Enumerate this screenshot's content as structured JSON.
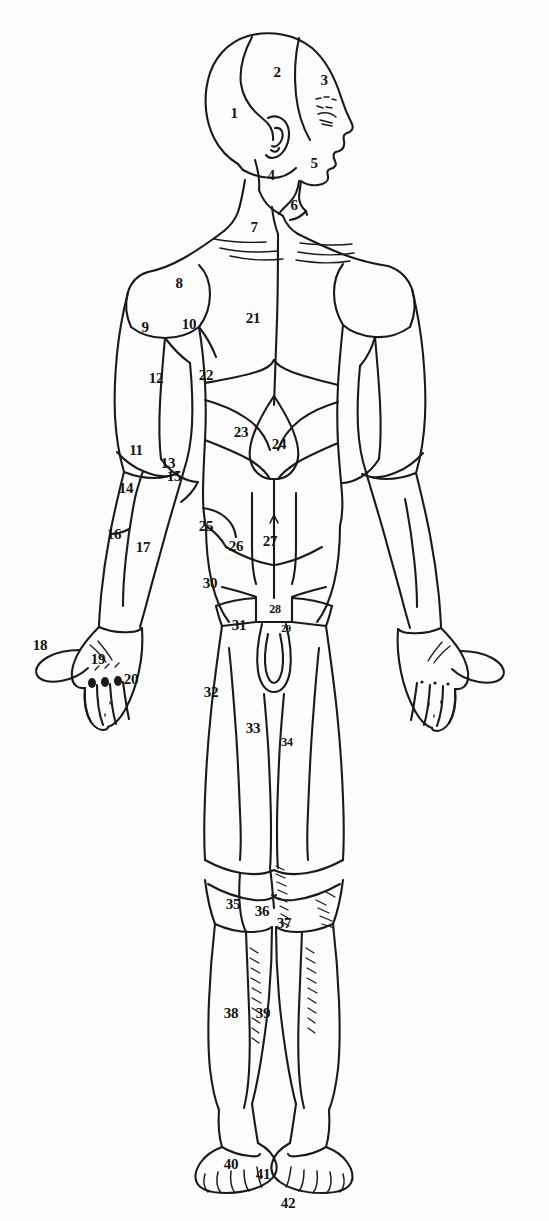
{
  "figure": {
    "style": {
      "background_color": "#fdfdfd",
      "line_color": "#1a1a1a",
      "label_color": "#141414"
    },
    "label_count": 42,
    "labels": [
      {
        "id": "1",
        "text": "1",
        "x": 234,
        "y": 113,
        "size": "md"
      },
      {
        "id": "2",
        "text": "2",
        "x": 277,
        "y": 72,
        "size": "md"
      },
      {
        "id": "3",
        "text": "3",
        "x": 324,
        "y": 80,
        "size": "md"
      },
      {
        "id": "4",
        "text": "4",
        "x": 271,
        "y": 175,
        "size": "md"
      },
      {
        "id": "5",
        "text": "5",
        "x": 314,
        "y": 163,
        "size": "md"
      },
      {
        "id": "6",
        "text": "6",
        "x": 294,
        "y": 205,
        "size": "md"
      },
      {
        "id": "7",
        "text": "7",
        "x": 254,
        "y": 227,
        "size": "md"
      },
      {
        "id": "8",
        "text": "8",
        "x": 179,
        "y": 283,
        "size": "md"
      },
      {
        "id": "9",
        "text": "9",
        "x": 145,
        "y": 327,
        "size": "md"
      },
      {
        "id": "10",
        "text": "10",
        "x": 189,
        "y": 324,
        "size": "md"
      },
      {
        "id": "11",
        "text": "11",
        "x": 136,
        "y": 450,
        "size": "md"
      },
      {
        "id": "12",
        "text": "12",
        "x": 156,
        "y": 378,
        "size": "md"
      },
      {
        "id": "13",
        "text": "13",
        "x": 168,
        "y": 463,
        "size": "md"
      },
      {
        "id": "14",
        "text": "14",
        "x": 126,
        "y": 488,
        "size": "md"
      },
      {
        "id": "15",
        "text": "15",
        "x": 174,
        "y": 476,
        "size": "md"
      },
      {
        "id": "16",
        "text": "16",
        "x": 114,
        "y": 534,
        "size": "md"
      },
      {
        "id": "17",
        "text": "17",
        "x": 143,
        "y": 547,
        "size": "md"
      },
      {
        "id": "18",
        "text": "18",
        "x": 40,
        "y": 645,
        "size": "md"
      },
      {
        "id": "19",
        "text": "19",
        "x": 98,
        "y": 659,
        "size": "md"
      },
      {
        "id": "20",
        "text": "20",
        "x": 131,
        "y": 679,
        "size": "md"
      },
      {
        "id": "21",
        "text": "21",
        "x": 253,
        "y": 318,
        "size": "md"
      },
      {
        "id": "22",
        "text": "22",
        "x": 206,
        "y": 375,
        "size": "md"
      },
      {
        "id": "23",
        "text": "23",
        "x": 241,
        "y": 432,
        "size": "md"
      },
      {
        "id": "24",
        "text": "24",
        "x": 279,
        "y": 444,
        "size": "md"
      },
      {
        "id": "25",
        "text": "25",
        "x": 206,
        "y": 526,
        "size": "md"
      },
      {
        "id": "26",
        "text": "26",
        "x": 236,
        "y": 546,
        "size": "md"
      },
      {
        "id": "27",
        "text": "27",
        "x": 270,
        "y": 541,
        "size": "md"
      },
      {
        "id": "28",
        "text": "28",
        "x": 275,
        "y": 609,
        "size": "sm"
      },
      {
        "id": "29",
        "text": "29",
        "x": 286,
        "y": 629,
        "size": "xs"
      },
      {
        "id": "30",
        "text": "30",
        "x": 210,
        "y": 583,
        "size": "md"
      },
      {
        "id": "31",
        "text": "31",
        "x": 239,
        "y": 625,
        "size": "md"
      },
      {
        "id": "32",
        "text": "32",
        "x": 211,
        "y": 692,
        "size": "md"
      },
      {
        "id": "33",
        "text": "33",
        "x": 253,
        "y": 728,
        "size": "md"
      },
      {
        "id": "34",
        "text": "34",
        "x": 287,
        "y": 742,
        "size": "sm"
      },
      {
        "id": "35",
        "text": "35",
        "x": 233,
        "y": 904,
        "size": "md"
      },
      {
        "id": "36",
        "text": "36",
        "x": 262,
        "y": 911,
        "size": "md"
      },
      {
        "id": "37",
        "text": "37",
        "x": 284,
        "y": 923,
        "size": "md"
      },
      {
        "id": "38",
        "text": "38",
        "x": 231,
        "y": 1013,
        "size": "md"
      },
      {
        "id": "39",
        "text": "39",
        "x": 263,
        "y": 1013,
        "size": "md"
      },
      {
        "id": "40",
        "text": "40",
        "x": 231,
        "y": 1164,
        "size": "md"
      },
      {
        "id": "41",
        "text": "41",
        "x": 263,
        "y": 1174,
        "size": "md"
      },
      {
        "id": "42",
        "text": "42",
        "x": 288,
        "y": 1203,
        "size": "md"
      }
    ]
  }
}
